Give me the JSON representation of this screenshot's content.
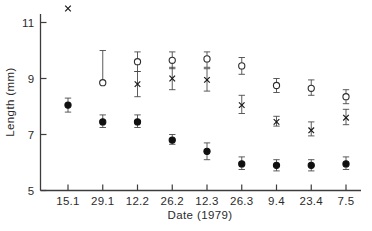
{
  "chart_data": {
    "type": "scatter",
    "title": "",
    "xlabel": "Date (1979)",
    "ylabel": "Length (mm)",
    "grid": false,
    "legend": "none",
    "categories": [
      "15.1",
      "29.1",
      "12.2",
      "26.2",
      "12.3",
      "26.3",
      "9.4",
      "23.4",
      "7.5"
    ],
    "x_tick_labels": [
      "15.1",
      "29.1",
      "12.2",
      "26.2",
      "12.3",
      "26.3",
      "9.4",
      "23.4",
      "7.5"
    ],
    "y_tick_labels": [
      "5",
      "7",
      "9",
      "11"
    ],
    "y_ticks": [
      5,
      7,
      9,
      11
    ],
    "ylim": [
      5,
      11
    ],
    "series": [
      {
        "name": "open-circle",
        "marker": "open-circle",
        "values": [
          null,
          8.85,
          9.6,
          9.65,
          9.7,
          9.45,
          8.75,
          8.65,
          8.35
        ],
        "err_low": [
          null,
          8.85,
          9.25,
          9.35,
          9.4,
          9.15,
          8.5,
          8.4,
          8.1
        ],
        "err_high": [
          null,
          10.0,
          9.95,
          9.95,
          9.95,
          9.75,
          9.0,
          8.95,
          8.6
        ]
      },
      {
        "name": "cross",
        "marker": "cross",
        "values": [
          11.5,
          null,
          8.8,
          9.0,
          8.95,
          8.05,
          7.45,
          7.15,
          7.6
        ],
        "err_low": [
          null,
          null,
          8.35,
          8.6,
          8.55,
          7.75,
          7.3,
          6.95,
          7.35
        ],
        "err_high": [
          null,
          null,
          9.25,
          9.4,
          9.35,
          8.4,
          7.65,
          7.45,
          7.9
        ]
      },
      {
        "name": "filled-circle",
        "marker": "filled-circle",
        "values": [
          8.05,
          7.45,
          7.45,
          6.8,
          6.4,
          5.95,
          5.9,
          5.9,
          5.95
        ],
        "err_low": [
          7.8,
          7.25,
          7.25,
          6.65,
          6.1,
          5.75,
          5.7,
          5.7,
          5.75
        ],
        "err_high": [
          8.3,
          7.7,
          7.7,
          7.0,
          6.7,
          6.2,
          6.1,
          6.1,
          6.2
        ]
      }
    ]
  },
  "axis": {
    "y_label": "Length (mm)",
    "x_label": "Date (1979)"
  }
}
